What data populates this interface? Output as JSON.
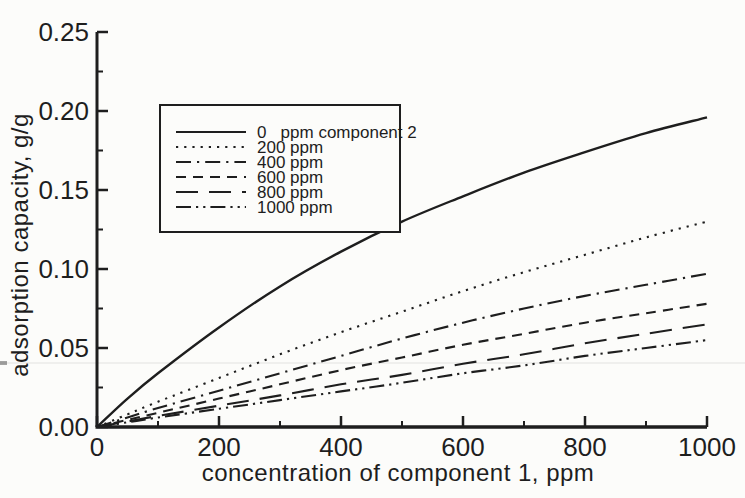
{
  "figure": {
    "background": "#fcfcfa",
    "ink": "#1e1e1e"
  },
  "chart_data": {
    "type": "line",
    "title": "",
    "xlabel": "concentration of component 1, ppm",
    "ylabel": "adsorption capacity, g/g",
    "xlim": [
      0,
      1000
    ],
    "ylim": [
      0,
      0.25
    ],
    "grid": false,
    "legend_position": "upper-left-inside",
    "x_major_ticks": [
      0,
      200,
      400,
      600,
      800,
      1000
    ],
    "x_tick_labels": [
      "0",
      "200",
      "400",
      "600",
      "800",
      "1000"
    ],
    "x_minor_ticks": [
      100,
      300,
      500,
      700,
      900
    ],
    "y_major_ticks": [
      0,
      0.05,
      0.1,
      0.15,
      0.2,
      0.25
    ],
    "y_tick_labels": [
      "0.00",
      "0.05",
      "0.10",
      "0.15",
      "0.20",
      "0.25"
    ],
    "y_minor_ticks": [
      0.025,
      0.075,
      0.125,
      0.175,
      0.225
    ],
    "x": [
      0,
      50,
      100,
      200,
      300,
      400,
      500,
      600,
      700,
      800,
      900,
      1000
    ],
    "series": [
      {
        "label": "0   ppm component 2",
        "linestyle": "solid",
        "dasharray": "",
        "values": [
          0,
          0.018,
          0.034,
          0.063,
          0.089,
          0.111,
          0.13,
          0.146,
          0.161,
          0.174,
          0.186,
          0.196
        ]
      },
      {
        "label": "200 ppm",
        "linestyle": "dotted",
        "dasharray": "2.2 6",
        "values": [
          0,
          0.008,
          0.016,
          0.031,
          0.046,
          0.06,
          0.073,
          0.086,
          0.098,
          0.109,
          0.12,
          0.13
        ]
      },
      {
        "label": "400 ppm",
        "linestyle": "dash-dot",
        "dasharray": "15 6 2.2 6",
        "values": [
          0,
          0.006,
          0.012,
          0.023,
          0.034,
          0.045,
          0.056,
          0.066,
          0.075,
          0.083,
          0.09,
          0.097
        ]
      },
      {
        "label": "600 ppm",
        "linestyle": "dashed",
        "dasharray": "10 7",
        "values": [
          0,
          0.0045,
          0.009,
          0.018,
          0.027,
          0.036,
          0.044,
          0.052,
          0.059,
          0.066,
          0.072,
          0.078
        ]
      },
      {
        "label": "800 ppm",
        "linestyle": "long-dash",
        "dasharray": "22 11",
        "values": [
          0,
          0.0035,
          0.007,
          0.0135,
          0.02,
          0.027,
          0.033,
          0.04,
          0.046,
          0.053,
          0.059,
          0.065
        ]
      },
      {
        "label": "1000 ppm",
        "linestyle": "dash-dot-dot",
        "dasharray": "15 5 2.2 5 2.2 5",
        "values": [
          0,
          0.003,
          0.006,
          0.0115,
          0.017,
          0.0225,
          0.028,
          0.034,
          0.039,
          0.045,
          0.05,
          0.055
        ]
      }
    ]
  }
}
